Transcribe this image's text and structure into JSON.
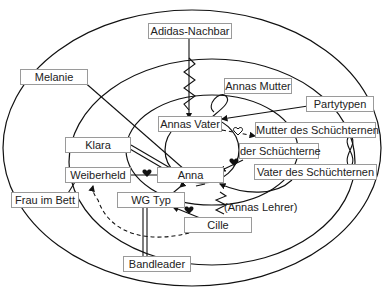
{
  "diagram": {
    "type": "social-network-circles",
    "rings": [
      "outer",
      "middle",
      "inner"
    ],
    "nodes": [
      {
        "id": "adidas",
        "label": "Adidas-Nachbar"
      },
      {
        "id": "melanie",
        "label": "Melanie"
      },
      {
        "id": "annas_mutter",
        "label": "Annas Mutter"
      },
      {
        "id": "partytypen",
        "label": "Partytypen"
      },
      {
        "id": "annas_vater",
        "label": "Annas Vater"
      },
      {
        "id": "mutter_schuecht",
        "label": "Mutter des Schüchternen"
      },
      {
        "id": "klara",
        "label": "Klara"
      },
      {
        "id": "der_schuecht",
        "label": "der Schüchterne"
      },
      {
        "id": "weiberheld",
        "label": "Weiberheld"
      },
      {
        "id": "anna",
        "label": "Anna"
      },
      {
        "id": "vater_schuecht",
        "label": "Vater des Schüchternen"
      },
      {
        "id": "frau_bett",
        "label": "Frau im Bett"
      },
      {
        "id": "wg_typ",
        "label": "WG Typ"
      },
      {
        "id": "annas_lehrer",
        "label": "(Annas Lehrer)"
      },
      {
        "id": "cille",
        "label": "Cille"
      },
      {
        "id": "bandleader",
        "label": "Bandleader"
      }
    ],
    "edge_symbols": [
      "arrow",
      "zigzag-conflict",
      "double-line-strong-tie",
      "heart",
      "open-heart",
      "loop-ambivalent",
      "dashed-line"
    ]
  }
}
